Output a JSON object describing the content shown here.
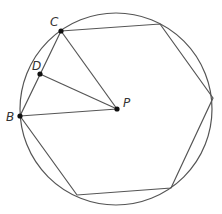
{
  "diagram": {
    "type": "geometry",
    "colors": {
      "stroke": "#555555",
      "point": "#111111",
      "label": "#333333",
      "background": "#ffffff"
    },
    "circle": {
      "cx": 116,
      "cy": 109,
      "r": 96
    },
    "hexagon_vertices": [
      {
        "name": "C",
        "x": 61,
        "y": 31
      },
      {
        "name": "top-right",
        "x": 160,
        "y": 24
      },
      {
        "name": "right",
        "x": 213,
        "y": 98
      },
      {
        "name": "bottom-right",
        "x": 171,
        "y": 188
      },
      {
        "name": "bottom-left",
        "x": 77,
        "y": 195
      },
      {
        "name": "B",
        "x": 20,
        "y": 116
      }
    ],
    "points": [
      {
        "name": "C",
        "label": "C",
        "x": 61,
        "y": 31,
        "label_x": 50,
        "label_y": 26
      },
      {
        "name": "D",
        "label": "D",
        "x": 40,
        "y": 74,
        "label_x": 32,
        "label_y": 69
      },
      {
        "name": "B",
        "label": "B",
        "x": 20,
        "y": 116,
        "label_x": 6,
        "label_y": 120
      },
      {
        "name": "P",
        "label": "P",
        "x": 117,
        "y": 109,
        "label_x": 123,
        "label_y": 107
      }
    ],
    "segments": [
      {
        "from": "P",
        "to": "C"
      },
      {
        "from": "P",
        "to": "D"
      },
      {
        "from": "P",
        "to": "B"
      }
    ],
    "labels": {
      "C": "C",
      "D": "D",
      "B": "B",
      "P": "P"
    }
  }
}
